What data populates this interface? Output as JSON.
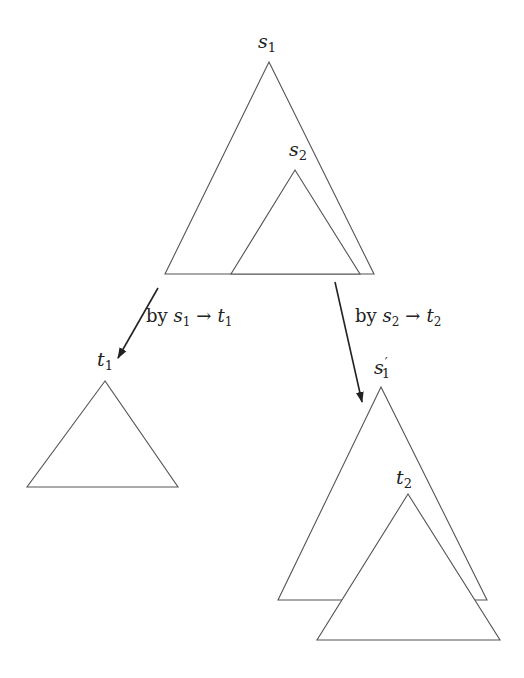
{
  "diagram": {
    "colors": {
      "stroke": "#555555",
      "arrow": "#222222",
      "background": "#ffffff"
    },
    "nodes": {
      "s1": {
        "base": "s",
        "sub": "1",
        "prime": ""
      },
      "s2": {
        "base": "s",
        "sub": "2",
        "prime": ""
      },
      "t1": {
        "base": "t",
        "sub": "1",
        "prime": ""
      },
      "s1p": {
        "base": "s",
        "sub": "1",
        "prime": "′"
      },
      "t2": {
        "base": "t",
        "sub": "2",
        "prime": ""
      }
    },
    "edges": [
      {
        "by": "by",
        "lhs_base": "s",
        "lhs_sub": "1",
        "arrow": "→",
        "rhs_base": "t",
        "rhs_sub": "1"
      },
      {
        "by": "by",
        "lhs_base": "s",
        "lhs_sub": "2",
        "arrow": "→",
        "rhs_base": "t",
        "rhs_sub": "2"
      }
    ],
    "triangles": [
      {
        "id": "s1",
        "points": [
          [
            269,
            62
          ],
          [
            165,
            274
          ],
          [
            374,
            274
          ]
        ]
      },
      {
        "id": "s2",
        "points": [
          [
            295,
            170
          ],
          [
            231,
            274
          ],
          [
            360,
            274
          ]
        ]
      },
      {
        "id": "t1",
        "points": [
          [
            105,
            381
          ],
          [
            27,
            487
          ],
          [
            178,
            487
          ]
        ]
      },
      {
        "id": "s1p",
        "points": [
          [
            381,
            387
          ],
          [
            278,
            600
          ],
          [
            487,
            600
          ]
        ]
      },
      {
        "id": "t2",
        "points": [
          [
            408,
            494
          ],
          [
            317,
            640
          ],
          [
            500,
            640
          ]
        ]
      }
    ]
  }
}
